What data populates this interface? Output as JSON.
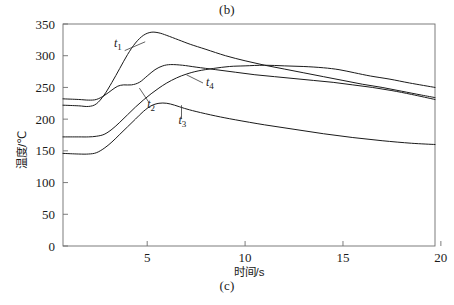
{
  "figure": {
    "caption_top": "(b)",
    "caption_bottom": "(c)"
  },
  "chart_data": {
    "type": "line",
    "title": "",
    "xlabel": "时间/s",
    "ylabel": "温度/℃",
    "xlim": [
      0.7,
      19.7
    ],
    "ylim": [
      0,
      350
    ],
    "xticks": [
      5,
      10,
      15,
      20
    ],
    "xtick_labels": [
      "5",
      "10",
      "15",
      "20"
    ],
    "yticks": [
      0,
      50,
      100,
      150,
      200,
      250,
      300,
      350
    ],
    "ytick_labels": [
      "0",
      "50",
      "100",
      "150",
      "200",
      "250",
      "300",
      "350"
    ],
    "grid": false,
    "legend": "inline-labels",
    "annotations": [
      {
        "text": "t",
        "sub": "1",
        "x": 3.3,
        "y": 313
      },
      {
        "text": "t",
        "sub": "2",
        "x": 5.0,
        "y": 218
      },
      {
        "text": "t",
        "sub": "3",
        "x": 6.6,
        "y": 192
      },
      {
        "text": "t",
        "sub": "4",
        "x": 8.0,
        "y": 253
      }
    ],
    "series": [
      {
        "name": "t1",
        "label": "t₁",
        "x": [
          0.7,
          1.5,
          2.0,
          2.4,
          2.8,
          3.2,
          3.6,
          4.0,
          4.4,
          4.8,
          5.2,
          5.6,
          6.0,
          6.6,
          7.2,
          8.0,
          9.0,
          10.0,
          11.0,
          12.0,
          13.0,
          14.0,
          15.0,
          16.0,
          17.0,
          18.0,
          19.0,
          19.7
        ],
        "values": [
          222,
          221,
          220,
          224,
          238,
          258,
          280,
          302,
          320,
          332,
          337,
          336,
          332,
          325,
          318,
          310,
          300,
          292,
          285,
          279,
          273,
          267,
          261,
          255,
          250,
          244,
          238,
          234
        ]
      },
      {
        "name": "t2",
        "label": "t₂",
        "x": [
          0.7,
          1.5,
          2.0,
          2.4,
          2.8,
          3.2,
          3.5,
          3.8,
          4.2,
          4.6,
          5.0,
          5.4,
          5.8,
          6.2,
          6.8,
          7.5,
          8.5,
          9.5,
          10.5,
          11.5,
          12.5,
          13.5,
          14.5,
          15.5,
          16.5,
          17.5,
          18.5,
          19.7
        ],
        "values": [
          232,
          231,
          230,
          231,
          237,
          246,
          252,
          254,
          254,
          258,
          268,
          278,
          284,
          286,
          285,
          282,
          278,
          274,
          270,
          267,
          264,
          261,
          258,
          254,
          250,
          245,
          239,
          231
        ]
      },
      {
        "name": "t3",
        "label": "t₃",
        "x": [
          0.7,
          1.5,
          2.0,
          2.4,
          2.8,
          3.2,
          3.6,
          4.0,
          4.4,
          4.8,
          5.2,
          5.6,
          6.0,
          6.4,
          6.9,
          7.5,
          8.5,
          9.5,
          11.0,
          12.5,
          14.0,
          15.5,
          17.0,
          18.5,
          19.7
        ],
        "values": [
          146,
          145,
          145,
          147,
          154,
          164,
          176,
          188,
          200,
          212,
          221,
          225,
          225,
          222,
          217,
          212,
          205,
          199,
          191,
          184,
          177,
          171,
          166,
          162,
          160
        ]
      },
      {
        "name": "t4",
        "label": "t₄",
        "x": [
          0.7,
          1.5,
          2.0,
          2.4,
          2.8,
          3.2,
          3.6,
          4.0,
          4.4,
          4.8,
          5.2,
          5.6,
          6.0,
          6.5,
          7.0,
          7.6,
          8.4,
          9.2,
          10.0,
          11.0,
          12.0,
          13.0,
          14.0,
          14.8,
          15.6,
          16.4,
          17.4,
          18.4,
          19.7
        ],
        "values": [
          172,
          172,
          172,
          173,
          176,
          184,
          195,
          207,
          219,
          230,
          240,
          249,
          257,
          265,
          271,
          276,
          280,
          283,
          284,
          285,
          284,
          283,
          281,
          278,
          273,
          268,
          263,
          257,
          250
        ]
      }
    ]
  }
}
